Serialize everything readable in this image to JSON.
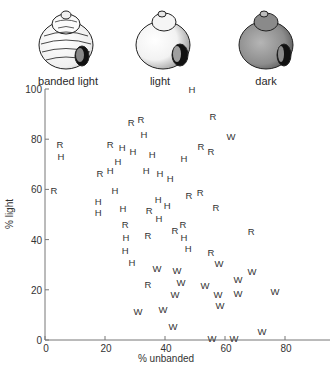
{
  "legend": {
    "shells": [
      {
        "key": "banded-light",
        "label": "banded light",
        "pattern": "banded"
      },
      {
        "key": "light",
        "label": "light",
        "pattern": "light"
      },
      {
        "key": "dark",
        "label": "dark",
        "pattern": "dark"
      }
    ]
  },
  "chart_data": {
    "type": "scatter",
    "title": "",
    "xlabel": "% unbanded",
    "ylabel": "% light",
    "xlim": [
      0,
      95
    ],
    "ylim": [
      0,
      100
    ],
    "xticks": [
      0,
      20,
      40,
      60,
      80
    ],
    "yticks": [
      0,
      20,
      40,
      60,
      80,
      100
    ],
    "xtick_labels": [
      "0",
      "20",
      "40",
      "60",
      "80"
    ],
    "ytick_labels": [
      "0",
      "20",
      "40",
      "60",
      "80",
      "100"
    ],
    "grid": false,
    "marker_legend": {
      "H": "H",
      "R": "R",
      "W": "W"
    },
    "points": [
      {
        "label": "H",
        "x": 49,
        "y": 100
      },
      {
        "label": "R",
        "x": 28.7,
        "y": 86.5
      },
      {
        "label": "R",
        "x": 32,
        "y": 88
      },
      {
        "label": "R",
        "x": 56,
        "y": 89
      },
      {
        "label": "H",
        "x": 33,
        "y": 82
      },
      {
        "label": "W",
        "x": 62,
        "y": 81
      },
      {
        "label": "R",
        "x": 5,
        "y": 78
      },
      {
        "label": "H",
        "x": 5.3,
        "y": 73
      },
      {
        "label": "R",
        "x": 21.7,
        "y": 78
      },
      {
        "label": "H",
        "x": 25.7,
        "y": 76.5
      },
      {
        "label": "H",
        "x": 29.3,
        "y": 75
      },
      {
        "label": "R",
        "x": 52,
        "y": 77
      },
      {
        "label": "R",
        "x": 55.3,
        "y": 75
      },
      {
        "label": "H",
        "x": 35.7,
        "y": 74
      },
      {
        "label": "H",
        "x": 46.3,
        "y": 72.5
      },
      {
        "label": "H",
        "x": 24.3,
        "y": 71
      },
      {
        "label": "R",
        "x": 18.3,
        "y": 66.5
      },
      {
        "label": "H",
        "x": 21.7,
        "y": 67.7
      },
      {
        "label": "H",
        "x": 33.7,
        "y": 67.7
      },
      {
        "label": "H",
        "x": 38.3,
        "y": 66.5
      },
      {
        "label": "H",
        "x": 41.7,
        "y": 64.5
      },
      {
        "label": "R",
        "x": 3,
        "y": 59.4
      },
      {
        "label": "H",
        "x": 23.3,
        "y": 59.4
      },
      {
        "label": "R",
        "x": 48,
        "y": 57.4
      },
      {
        "label": "R",
        "x": 51.7,
        "y": 58.6
      },
      {
        "label": "H",
        "x": 17.7,
        "y": 55
      },
      {
        "label": "H",
        "x": 17.7,
        "y": 50.6
      },
      {
        "label": "H",
        "x": 26,
        "y": 52.2
      },
      {
        "label": "R",
        "x": 34.7,
        "y": 51.4
      },
      {
        "label": "H",
        "x": 37.7,
        "y": 55.8
      },
      {
        "label": "H",
        "x": 40.7,
        "y": 53.4
      },
      {
        "label": "H",
        "x": 38,
        "y": 48.6
      },
      {
        "label": "R",
        "x": 57,
        "y": 52.6
      },
      {
        "label": "R",
        "x": 26.7,
        "y": 46.2
      },
      {
        "label": "R",
        "x": 43.3,
        "y": 43.8
      },
      {
        "label": "R",
        "x": 46,
        "y": 46.2
      },
      {
        "label": "H",
        "x": 27,
        "y": 41
      },
      {
        "label": "R",
        "x": 34.3,
        "y": 41.8
      },
      {
        "label": "H",
        "x": 46.3,
        "y": 41
      },
      {
        "label": "R",
        "x": 68.7,
        "y": 43.4
      },
      {
        "label": "H",
        "x": 26.7,
        "y": 35.5
      },
      {
        "label": "H",
        "x": 47.7,
        "y": 36.3
      },
      {
        "label": "R",
        "x": 55.3,
        "y": 35
      },
      {
        "label": "H",
        "x": 29,
        "y": 30.7
      },
      {
        "label": "W",
        "x": 58,
        "y": 30.3
      },
      {
        "label": "W",
        "x": 37.3,
        "y": 28.3
      },
      {
        "label": "W",
        "x": 44,
        "y": 27.5
      },
      {
        "label": "W",
        "x": 69,
        "y": 27.1
      },
      {
        "label": "W",
        "x": 64.3,
        "y": 24.3
      },
      {
        "label": "W",
        "x": 45.3,
        "y": 23.1
      },
      {
        "label": "R",
        "x": 34.3,
        "y": 22.3
      },
      {
        "label": "W",
        "x": 53.3,
        "y": 21.9
      },
      {
        "label": "W",
        "x": 57.7,
        "y": 18.3
      },
      {
        "label": "W",
        "x": 43.3,
        "y": 18.3
      },
      {
        "label": "W",
        "x": 64.3,
        "y": 18.7
      },
      {
        "label": "W",
        "x": 76.7,
        "y": 19.5
      },
      {
        "label": "W",
        "x": 31,
        "y": 11.2
      },
      {
        "label": "W",
        "x": 39.3,
        "y": 12
      },
      {
        "label": "W",
        "x": 58.3,
        "y": 13.9
      },
      {
        "label": "W",
        "x": 42.7,
        "y": 5.2
      },
      {
        "label": "W",
        "x": 55.7,
        "y": 0.4
      },
      {
        "label": "W",
        "x": 63,
        "y": 0.4
      },
      {
        "label": "W",
        "x": 72.3,
        "y": 3.2
      }
    ]
  }
}
